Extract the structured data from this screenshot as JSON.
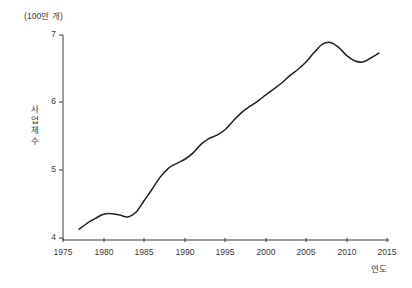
{
  "chart_data": {
    "type": "line",
    "title": "",
    "subtitle": "",
    "unit_label": "(100만 개)",
    "ylabel": "사업체 수",
    "xlabel": "연도",
    "grid": false,
    "legend": null,
    "xlim": [
      1975,
      2015
    ],
    "ylim": [
      4,
      7
    ],
    "xticks": [
      "1975",
      "1980",
      "1985",
      "1990",
      "1995",
      "2000",
      "2005",
      "2010",
      "2015"
    ],
    "yticks": [
      "4",
      "5",
      "6",
      "7"
    ],
    "line_color": "#231f20",
    "series": [
      {
        "name": "사업체 수",
        "x": [
          1977,
          1978,
          1979,
          1980,
          1981,
          1982,
          1983,
          1984,
          1985,
          1986,
          1987,
          1988,
          1989,
          1990,
          1991,
          1992,
          1993,
          1994,
          1995,
          1996,
          1997,
          1998,
          1999,
          2000,
          2001,
          2002,
          2003,
          2004,
          2005,
          2006,
          2007,
          2008,
          2009,
          2010,
          2011,
          2012,
          2013,
          2014
        ],
        "values": [
          4.13,
          4.22,
          4.29,
          4.35,
          4.36,
          4.34,
          4.31,
          4.38,
          4.55,
          4.72,
          4.9,
          5.03,
          5.1,
          5.16,
          5.25,
          5.38,
          5.47,
          5.52,
          5.6,
          5.73,
          5.85,
          5.94,
          6.02,
          6.11,
          6.2,
          6.29,
          6.4,
          6.49,
          6.6,
          6.74,
          6.86,
          6.89,
          6.82,
          6.7,
          6.62,
          6.6,
          6.66,
          6.73
        ]
      }
    ]
  },
  "axis": {
    "ytick_positions": [
      {
        "label": "7",
        "y": 35
      },
      {
        "label": "6",
        "y": 102
      },
      {
        "label": "5",
        "y": 170
      },
      {
        "label": "4",
        "y": 238
      }
    ],
    "xtick_positions": [
      {
        "label": "1975",
        "x": 63
      },
      {
        "label": "1980",
        "x": 104
      },
      {
        "label": "1985",
        "x": 144
      },
      {
        "label": "1990",
        "x": 185
      },
      {
        "label": "1995",
        "x": 225
      },
      {
        "label": "2000",
        "x": 266
      },
      {
        "label": "2005",
        "x": 306
      },
      {
        "label": "2010",
        "x": 347
      },
      {
        "label": "2015",
        "x": 387
      }
    ]
  }
}
